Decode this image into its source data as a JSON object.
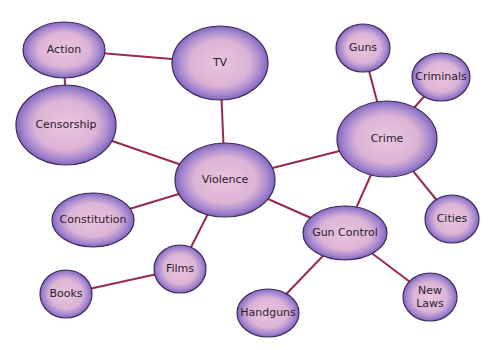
{
  "diagram": {
    "type": "concept-map",
    "colors": {
      "edge": "#9b2a4a",
      "node_fill_inner": "#e7c2dc",
      "node_fill_outer": "#8a6cc0",
      "node_stroke": "#3b2a5a",
      "text": "#2a1a2a",
      "background": "#ffffff"
    },
    "nodes": [
      {
        "id": "action",
        "label": "Action",
        "cx": 64,
        "cy": 50,
        "rx": 41,
        "ry": 28
      },
      {
        "id": "tv",
        "label": "TV",
        "cx": 220,
        "cy": 63,
        "rx": 48,
        "ry": 37
      },
      {
        "id": "censorship",
        "label": "Censorship",
        "cx": 66,
        "cy": 125,
        "rx": 50,
        "ry": 40
      },
      {
        "id": "violence",
        "label": "Violence",
        "cx": 225,
        "cy": 180,
        "rx": 50,
        "ry": 37
      },
      {
        "id": "guns",
        "label": "Guns",
        "cx": 363,
        "cy": 48,
        "rx": 27,
        "ry": 24
      },
      {
        "id": "criminals",
        "label": "Criminals",
        "cx": 441,
        "cy": 77,
        "rx": 29,
        "ry": 24
      },
      {
        "id": "crime",
        "label": "Crime",
        "cx": 387,
        "cy": 139,
        "rx": 50,
        "ry": 38
      },
      {
        "id": "constitution",
        "label": "Constitution",
        "cx": 93,
        "cy": 220,
        "rx": 41,
        "ry": 27
      },
      {
        "id": "films",
        "label": "Films",
        "cx": 180,
        "cy": 269,
        "rx": 26,
        "ry": 24
      },
      {
        "id": "books",
        "label": "Books",
        "cx": 66,
        "cy": 294,
        "rx": 26,
        "ry": 24
      },
      {
        "id": "cities",
        "label": "Cities",
        "cx": 452,
        "cy": 219,
        "rx": 27,
        "ry": 24
      },
      {
        "id": "gun-control",
        "label": "Gun Control",
        "cx": 345,
        "cy": 233,
        "rx": 42,
        "ry": 27
      },
      {
        "id": "new-laws",
        "label": "New Laws",
        "lines": [
          "New",
          "Laws"
        ],
        "cx": 430,
        "cy": 297,
        "rx": 27,
        "ry": 24
      },
      {
        "id": "handguns",
        "label": "Handguns",
        "cx": 268,
        "cy": 313,
        "rx": 31,
        "ry": 24
      }
    ],
    "edges": [
      {
        "from": "action",
        "to": "tv"
      },
      {
        "from": "action",
        "to": "censorship"
      },
      {
        "from": "tv",
        "to": "violence"
      },
      {
        "from": "censorship",
        "to": "violence"
      },
      {
        "from": "violence",
        "to": "constitution"
      },
      {
        "from": "violence",
        "to": "films"
      },
      {
        "from": "violence",
        "to": "crime"
      },
      {
        "from": "violence",
        "to": "gun-control"
      },
      {
        "from": "films",
        "to": "books"
      },
      {
        "from": "crime",
        "to": "guns"
      },
      {
        "from": "crime",
        "to": "criminals"
      },
      {
        "from": "crime",
        "to": "cities"
      },
      {
        "from": "crime",
        "to": "gun-control"
      },
      {
        "from": "gun-control",
        "to": "handguns"
      },
      {
        "from": "gun-control",
        "to": "new-laws"
      }
    ]
  }
}
